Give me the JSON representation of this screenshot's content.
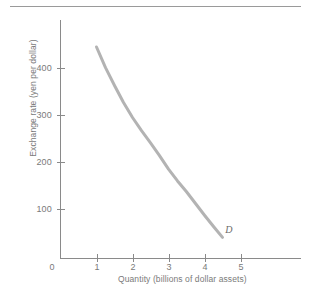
{
  "figure": {
    "background_color": "#ffffff",
    "rule_color": "#9a9a9a",
    "axis_color": "#8a8a8a",
    "curve_color": "#b3b3b3",
    "text_color": "#7a7a7a"
  },
  "chart_data": {
    "type": "line",
    "title": "",
    "subtitle": "",
    "xlabel": "Quantity (billions of dollar assets)",
    "ylabel": "Exchange rate (yen per dollar)",
    "xlim": [
      0,
      5.75
    ],
    "ylim": [
      0,
      480
    ],
    "xticks": [
      0,
      1,
      2,
      3,
      4,
      5
    ],
    "xtick_labels": [
      "0",
      "1",
      "2",
      "3",
      "4",
      "5"
    ],
    "yticks": [
      100,
      200,
      300,
      400
    ],
    "ytick_labels": [
      "100",
      "200",
      "300",
      "400"
    ],
    "grid": false,
    "legend": null,
    "series": [
      {
        "name": "D",
        "label": "D",
        "annotation": "D",
        "color": "#b3b3b3",
        "x": [
          1.0,
          1.25,
          1.5,
          1.75,
          2.0,
          2.25,
          2.5,
          2.75,
          3.0,
          3.25,
          3.5,
          3.75,
          4.0,
          4.25,
          4.5
        ],
        "y": [
          450,
          406,
          368,
          332,
          300,
          272,
          246,
          219,
          190,
          165,
          142,
          117,
          92,
          68,
          45
        ]
      }
    ],
    "annotations": [
      {
        "text": "D",
        "x": 4.66,
        "y": 58
      }
    ]
  }
}
